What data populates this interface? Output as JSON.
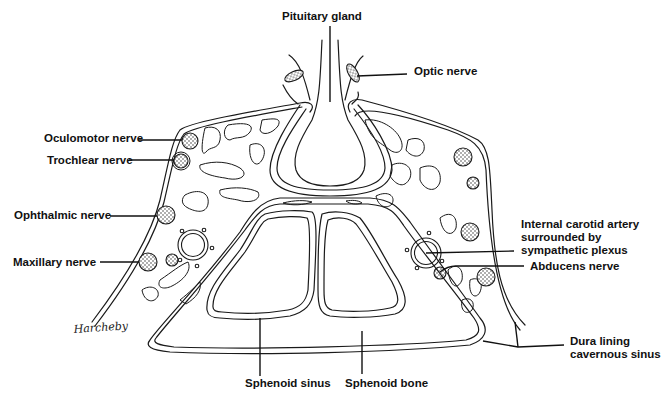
{
  "figure": {
    "signature": "Harcheby"
  },
  "labels": {
    "pituitary_gland": "Pituitary gland",
    "optic_nerve": "Optic nerve",
    "oculomotor_nerve": "Oculomotor nerve",
    "trochlear_nerve": "Trochlear nerve",
    "ophthalmic_nerve": "Ophthalmic nerve",
    "maxillary_nerve": "Maxillary nerve",
    "internal_carotid_line1": "Internal carotid artery",
    "internal_carotid_line2": "surrounded by",
    "internal_carotid_line3": "sympathetic plexus",
    "abducens_nerve": "Abducens nerve",
    "dura_line1": "Dura lining",
    "dura_line2": "cavernous sinus",
    "sphenoid_sinus": "Sphenoid sinus",
    "sphenoid_bone": "Sphenoid bone"
  },
  "colors": {
    "ink": "#111111",
    "background": "#ffffff"
  }
}
